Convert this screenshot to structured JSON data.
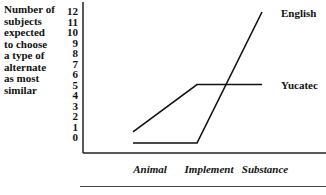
{
  "chart_data": {
    "type": "line",
    "title": "",
    "ylabel": "Number of subjects expected to choose a type of alternate as most similar",
    "ylabel_lines": [
      "Number of",
      "subjects",
      "expected",
      "to choose",
      "a type of",
      "alternate",
      "as most",
      "similar"
    ],
    "xlabel": "",
    "categories": [
      "Animal",
      "Implement",
      "Substance"
    ],
    "yticks": [
      12,
      11,
      10,
      9,
      8,
      7,
      6,
      5,
      4,
      3,
      2,
      1,
      0
    ],
    "ylim": [
      0,
      12
    ],
    "grid": false,
    "legend_position": "inline-right",
    "series": [
      {
        "name": "English",
        "values": [
          0,
          0,
          12
        ]
      },
      {
        "name": "Yucatec",
        "values": [
          0.5,
          5,
          5
        ]
      }
    ]
  }
}
